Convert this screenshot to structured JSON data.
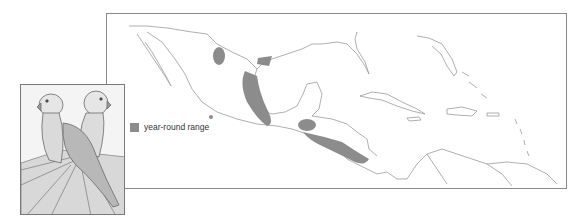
{
  "legend": {
    "items": [
      {
        "label": "year-round range",
        "color": "#8c8c8c"
      }
    ]
  },
  "map": {
    "region": "Mexico, Central America and Caribbean",
    "range_color": "#8c8c8c",
    "outline_color": "#9a9a9a",
    "frame_color": "#8a8a8a"
  },
  "illustration": {
    "subject": "two parakeets perched on a palm frond",
    "style": "pencil drawing"
  }
}
